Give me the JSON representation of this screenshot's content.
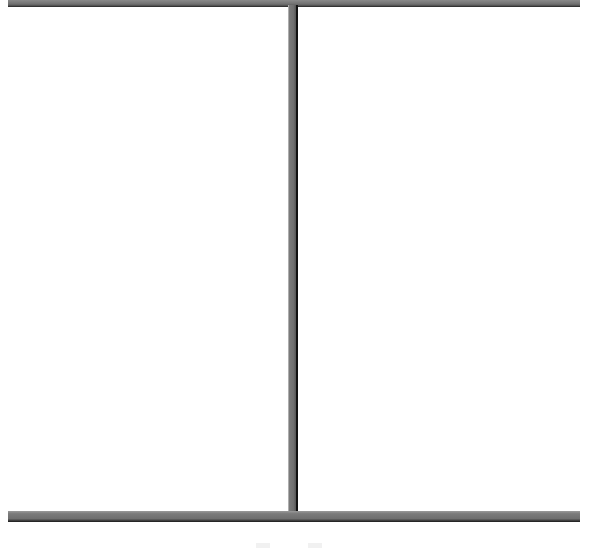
{
  "layout": {
    "panels": [
      {
        "id": "left",
        "content": ""
      },
      {
        "id": "right",
        "content": ""
      }
    ]
  },
  "colors": {
    "frame": "#6f6f6f",
    "frame_shadow": "#1e1e1e",
    "background": "#ffffff"
  }
}
